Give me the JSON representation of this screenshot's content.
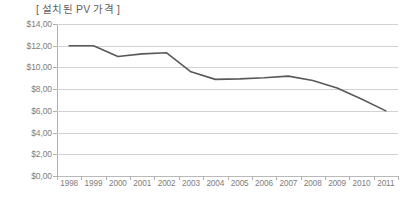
{
  "chart_data": {
    "type": "line",
    "title": "[ 설치된 PV 가격 ]",
    "xlabel": "",
    "ylabel": "",
    "categories": [
      "1998",
      "1999",
      "2000",
      "2001",
      "2002",
      "2003",
      "2004",
      "2005",
      "2006",
      "2007",
      "2008",
      "2009",
      "2010",
      "2011"
    ],
    "series": [
      {
        "name": "설치된 PV 가격",
        "color": "#595959",
        "values": [
          12.0,
          12.0,
          11.0,
          11.25,
          11.35,
          9.6,
          8.9,
          8.95,
          9.05,
          9.2,
          8.8,
          8.1,
          7.1,
          6.0
        ]
      }
    ],
    "ylim": [
      0,
      14
    ],
    "ytick_values": [
      14,
      12,
      10,
      8,
      6,
      4,
      2,
      0
    ],
    "ytick_labels": [
      "$14,00",
      "$12,00",
      "$10,00",
      "$8,00",
      "$6,00",
      "$4,00",
      "$2,00",
      "$0,00"
    ],
    "grid": true,
    "legend": false,
    "legend_position": "none",
    "gridline_color": "#d2d2d2",
    "axis_color": "#b0b0b0",
    "text_color": "#7d7d7d"
  }
}
